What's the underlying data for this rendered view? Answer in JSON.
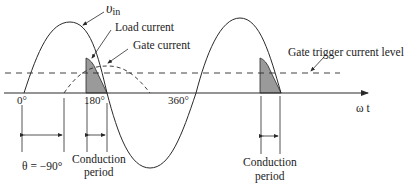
{
  "diagram": {
    "type": "scr-waveform",
    "labels": {
      "vin": "υ",
      "vin_sub": "in",
      "load_current": "Load current",
      "gate_current": "Gate current",
      "gate_trigger": "Gate trigger current level",
      "axis": "ω t",
      "deg0": "0°",
      "deg180": "180°",
      "deg360": "360°",
      "theta": "θ = −90°",
      "conduction1_line1": "Conduction",
      "conduction1_line2": "period",
      "conduction2_line1": "Conduction",
      "conduction2_line2": "period"
    },
    "colors": {
      "line": "#2a2a2a",
      "shade": "#9a9a9a",
      "background": "#ffffff"
    }
  }
}
